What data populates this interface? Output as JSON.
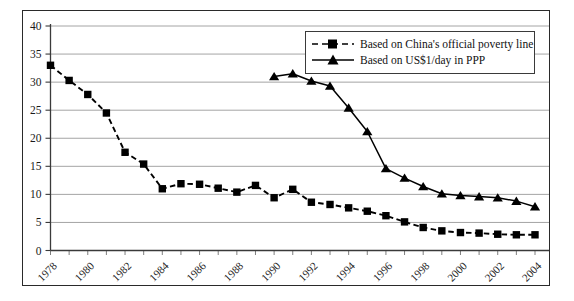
{
  "chart_data": {
    "type": "line",
    "title": "",
    "subtitle": "",
    "xlabel": "",
    "ylabel": "",
    "xlim": [
      1978,
      2004
    ],
    "ylim": [
      0,
      40
    ],
    "yticks": [
      0,
      5,
      10,
      15,
      20,
      25,
      30,
      35,
      40
    ],
    "xticks": [
      1978,
      1980,
      1982,
      1984,
      1986,
      1988,
      1990,
      1992,
      1994,
      1996,
      1998,
      2000,
      2002,
      2004
    ],
    "xtick_labels": [
      "1978",
      "1980",
      "1982",
      "1984",
      "1986",
      "1988",
      "1990",
      "1992",
      "1994",
      "1996",
      "1998",
      "2000",
      "2002",
      "2004"
    ],
    "ytick_labels": [
      "0",
      "5",
      "10",
      "15",
      "20",
      "25",
      "30",
      "35",
      "40"
    ],
    "grid": true,
    "grid_axis": "y",
    "legend_position": "upper-right",
    "x": [
      1978,
      1979,
      1980,
      1981,
      1982,
      1983,
      1984,
      1985,
      1986,
      1987,
      1988,
      1989,
      1990,
      1991,
      1992,
      1993,
      1994,
      1995,
      1996,
      1997,
      1998,
      1999,
      2000,
      2001,
      2002,
      2003,
      2004
    ],
    "series": [
      {
        "name": "Based on China's official poverty line",
        "marker": "square",
        "linestyle": "dashed",
        "color": "#000000",
        "x": [
          1978,
          1979,
          1980,
          1981,
          1982,
          1983,
          1984,
          1985,
          1986,
          1987,
          1988,
          1989,
          1990,
          1991,
          1992,
          1993,
          1994,
          1995,
          1996,
          1997,
          1998,
          1999,
          2000,
          2001,
          2002,
          2003,
          2004
        ],
        "values": [
          33.0,
          30.3,
          27.8,
          24.5,
          17.5,
          15.4,
          11.0,
          11.9,
          11.8,
          11.1,
          10.4,
          11.6,
          9.4,
          10.9,
          8.6,
          8.2,
          7.6,
          7.0,
          6.2,
          5.1,
          4.1,
          3.5,
          3.2,
          3.1,
          2.9,
          2.8,
          2.8
        ]
      },
      {
        "name": "Based on US$1/day in PPP",
        "marker": "triangle",
        "linestyle": "solid",
        "color": "#000000",
        "x": [
          1990,
          1991,
          1992,
          1993,
          1994,
          1995,
          1996,
          1997,
          1998,
          1999,
          2000,
          2001,
          2002,
          2003,
          2004
        ],
        "values": [
          31.0,
          31.5,
          30.2,
          29.3,
          25.4,
          21.2,
          14.6,
          12.9,
          11.4,
          10.1,
          9.8,
          9.6,
          9.4,
          8.8,
          7.8
        ]
      }
    ]
  },
  "legend": {
    "items": [
      {
        "label": "Based on China's official poverty line",
        "marker": "square",
        "linestyle": "dashed"
      },
      {
        "label": "Based on US$1/day in PPP",
        "marker": "triangle",
        "linestyle": "solid"
      }
    ]
  }
}
